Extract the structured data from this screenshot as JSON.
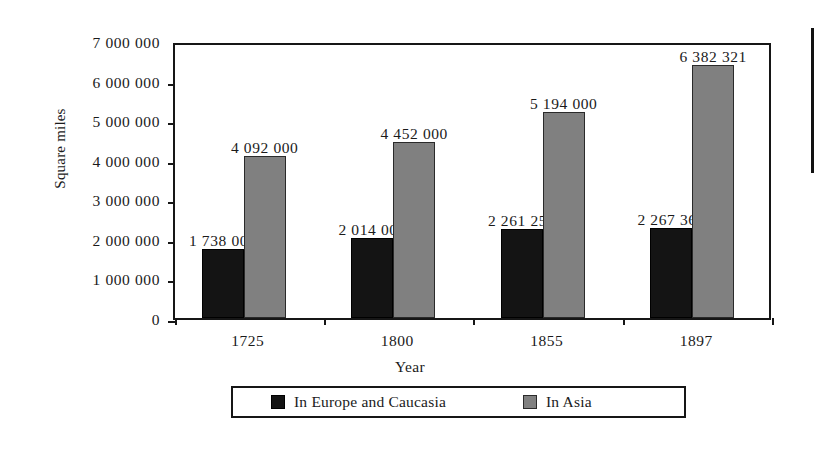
{
  "chart_data": {
    "type": "bar",
    "title": "",
    "xlabel": "Year",
    "ylabel": "Square miles",
    "categories": [
      "1725",
      "1800",
      "1855",
      "1897"
    ],
    "series": [
      {
        "name": "In Europe and Caucasia",
        "color": "#141414",
        "values": [
          1738000,
          2014000,
          2261250,
          2267360
        ],
        "value_labels": [
          "1 738 000",
          "2 014 000",
          "2 261 250",
          "2 267 360"
        ]
      },
      {
        "name": "In Asia",
        "color": "#808080",
        "values": [
          4092000,
          4452000,
          5194000,
          6382321
        ],
        "value_labels": [
          "4 092 000",
          "4 452 000",
          "5 194 000",
          "6 382 321"
        ]
      }
    ],
    "ylim": [
      0,
      7000000
    ],
    "y_ticks": [
      0,
      1000000,
      2000000,
      3000000,
      4000000,
      5000000,
      6000000,
      7000000
    ],
    "y_tick_labels": [
      "0",
      "1 000 000",
      "2 000 000",
      "3 000 000",
      "4 000 000",
      "5 000 000",
      "6 000 000",
      "7 000 000"
    ],
    "grid": false,
    "legend_position": "bottom"
  }
}
